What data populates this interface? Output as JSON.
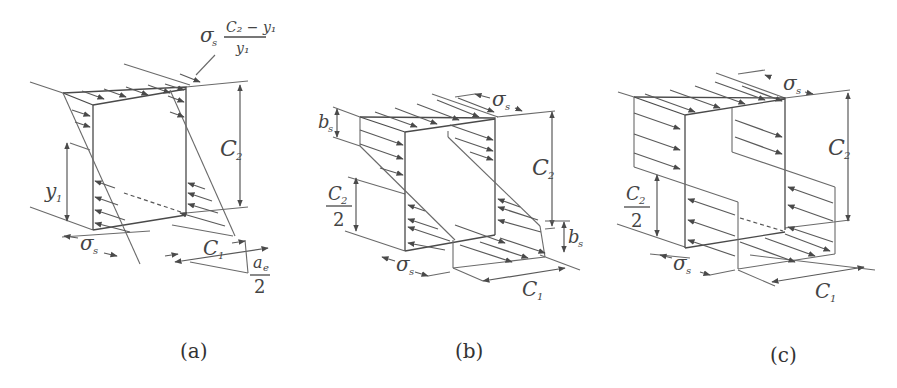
{
  "figure": {
    "panels": [
      {
        "id": "a",
        "caption": "(a)",
        "labels": {
          "stress_top": "σ",
          "stress_top_sub": "s",
          "fraction_num": "C₂ − y₁",
          "fraction_den": "y₁",
          "height": "C",
          "height_sub": "2",
          "y1": "y",
          "y1_sub": "1",
          "sigma_bottom": "σ",
          "sigma_bottom_sub": "s",
          "width": "C",
          "width_sub": "1",
          "ae": "a",
          "ae_sub": "e",
          "ae_den": "2"
        }
      },
      {
        "id": "b",
        "caption": "(b)",
        "labels": {
          "bs_top": "b",
          "bs_top_sub": "s",
          "sigma_top": "σ",
          "sigma_top_sub": "s",
          "height": "C",
          "height_sub": "2",
          "half_num": "C",
          "half_num_sub": "2",
          "half_den": "2",
          "bs_bottom": "b",
          "bs_bottom_sub": "s",
          "sigma_bottom": "σ",
          "sigma_bottom_sub": "s",
          "width": "C",
          "width_sub": "1"
        }
      },
      {
        "id": "c",
        "caption": "(c)",
        "labels": {
          "sigma_top": "σ",
          "sigma_top_sub": "s",
          "height": "C",
          "height_sub": "2",
          "half_num": "C",
          "half_num_sub": "2",
          "half_den": "2",
          "sigma_bottom": "σ",
          "sigma_bottom_sub": "s",
          "width": "C",
          "width_sub": "1"
        }
      }
    ]
  },
  "colors": {
    "line": "#6a6a6a",
    "text": "#444444",
    "background": "#ffffff"
  }
}
